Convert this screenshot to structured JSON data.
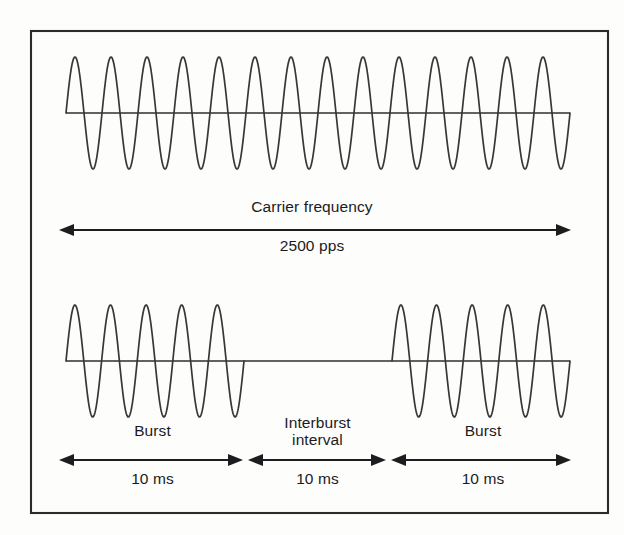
{
  "figure": {
    "background_color": "#fdfdfc",
    "frame": {
      "stroke_color": "#2b2b2e",
      "x": 31,
      "y": 31,
      "width": 577,
      "height": 482
    },
    "stroke_color": "#37373a"
  },
  "labels": {
    "carrier_frequency": "Carrier frequency",
    "carrier_rate": "2500 pps",
    "burst_left": "Burst",
    "interburst_interval": "Interburst\ninterval",
    "burst_right": "Burst",
    "duration_burst_left": "10 ms",
    "duration_interburst": "10 ms",
    "duration_burst_right": "10 ms"
  },
  "chart_data": {
    "type": "line",
    "xlabel": "",
    "ylabel": "",
    "grid": false,
    "legend_position": "none",
    "series": [
      {
        "name": "carrier-waveform",
        "description": "Continuous sinusoidal carrier, top trace",
        "cycles": 14,
        "amplitude": 56,
        "baseline_y": 113,
        "x_start": 66,
        "x_end": 570,
        "frequency_label": "2500 pps"
      },
      {
        "name": "burst-waveform",
        "description": "Modulated burst train, bottom trace: burst, interburst interval, burst",
        "baseline_y": 361,
        "x_start": 66,
        "x_end": 570,
        "segments": [
          {
            "kind": "burst",
            "cycles": 5,
            "x_start": 66,
            "x_end": 244,
            "duration": "10 ms"
          },
          {
            "kind": "interburst",
            "cycles": 0,
            "x_start": 244,
            "x_end": 392,
            "duration": "10 ms"
          },
          {
            "kind": "burst",
            "cycles": 5,
            "x_start": 392,
            "x_end": 570,
            "duration": "10 ms"
          }
        ]
      }
    ],
    "annotations": [
      {
        "name": "carrier-frequency-arrow",
        "text": "Carrier frequency",
        "sub_text": "2500 pps",
        "x_start": 60,
        "x_end": 570,
        "y": 230
      },
      {
        "name": "burst-left-arrow",
        "text": "Burst",
        "sub_text": "10 ms",
        "x_start": 60,
        "x_end": 242,
        "y": 460
      },
      {
        "name": "interburst-arrow",
        "text": "Interburst interval",
        "sub_text": "10 ms",
        "x_start": 248,
        "x_end": 385,
        "y": 460
      },
      {
        "name": "burst-right-arrow",
        "text": "Burst",
        "sub_text": "10 ms",
        "x_start": 391,
        "x_end": 570,
        "y": 460
      }
    ]
  }
}
